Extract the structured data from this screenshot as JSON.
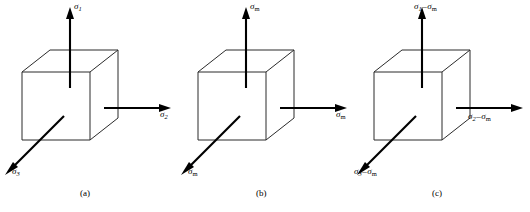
{
  "figure": {
    "background_color": "#ffffff",
    "line_color": "#2b2b2b",
    "arrow_color": "#000000",
    "panel_count": 3
  },
  "panels": [
    {
      "id": "a",
      "caption": "(a)",
      "labels": {
        "top": {
          "symbol": "σ",
          "sub": "1",
          "full": "σ1"
        },
        "right": {
          "symbol": "σ",
          "sub": "2",
          "full": "σ2"
        },
        "diagonal": {
          "symbol": "σ",
          "sub": "3",
          "full": "σ3"
        }
      }
    },
    {
      "id": "b",
      "caption": "(b)",
      "labels": {
        "top": {
          "symbol": "σ",
          "sub": "m",
          "full": "σm"
        },
        "right": {
          "symbol": "σ",
          "sub": "m",
          "full": "σm"
        },
        "diagonal": {
          "symbol": "σ",
          "sub": "m",
          "full": "σm"
        }
      }
    },
    {
      "id": "c",
      "caption": "(c)",
      "labels": {
        "top": {
          "symbol": "σ",
          "sub": "1",
          "op": "–",
          "symbol2": "σ",
          "sub2": "m",
          "full": "σ1–σm"
        },
        "right": {
          "symbol": "σ",
          "sub": "2",
          "op": "–",
          "symbol2": "σ",
          "sub2": "m",
          "full": "σ2–σm"
        },
        "diagonal": {
          "symbol": "σ",
          "sub": "3",
          "op": "–",
          "symbol2": "σ",
          "sub2": "m",
          "full": "σ3–σm"
        }
      }
    }
  ],
  "geometry": {
    "cube": {
      "front_face": {
        "x": 22,
        "y": 72,
        "width": 68,
        "height": 68
      },
      "depth_dx": 28,
      "depth_dy": -22
    },
    "arrows": {
      "vertical": {
        "from_y": 88,
        "to_y": 12,
        "x": 70
      },
      "horizontal": {
        "from_x": 104,
        "to_x": 168,
        "y": 108
      },
      "diagonal": {
        "from_x": 62,
        "from_y": 118,
        "to_x": 6,
        "to_y": 172
      }
    }
  }
}
